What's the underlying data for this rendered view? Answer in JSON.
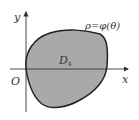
{
  "diagram": {
    "axes": {
      "x_label": "x",
      "y_label": "y",
      "origin_label": "O"
    },
    "curve_label": "ρ=φ(θ)",
    "region": {
      "label_main": "D",
      "label_sub": "4",
      "fill_color": "#a9a9a9",
      "stroke_color": "#222222"
    }
  }
}
